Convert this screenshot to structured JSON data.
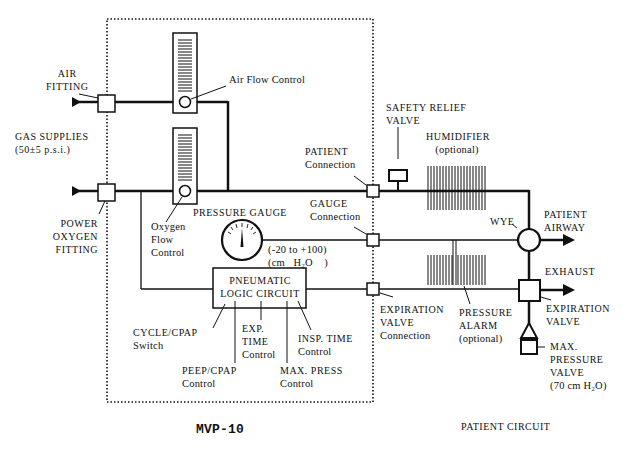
{
  "diagram": {
    "title": "MVP-10",
    "patient_circuit_title": "PATIENT CIRCUIT",
    "labels": {
      "air_fitting": [
        "AIR",
        "FITTING"
      ],
      "gas_supplies": [
        "GAS SUPPLIES",
        "(50±5 p.s.i.)"
      ],
      "power_oxygen_fitting": [
        "POWER",
        "OXYGEN",
        "FITTING"
      ],
      "air_flow_control": "Air Flow Control",
      "oxygen_flow_control": [
        "Oxygen",
        "Flow",
        "Control"
      ],
      "pressure_gauge": "PRESSURE GAUGE",
      "gauge_range": [
        "(-20 to +100)",
        "(cm   H₂O    )"
      ],
      "pneumatic_logic": [
        "PNEUMATIC",
        "LOGIC CIRCUIT"
      ],
      "cycle_cpap": [
        "CYCLE/CPAP",
        "Switch"
      ],
      "peep_cpap": [
        "PEEP/CPAP",
        "Control"
      ],
      "exp_time": [
        "EXP.",
        "TIME",
        "Control"
      ],
      "max_press": [
        "MAX. PRESS",
        "Control"
      ],
      "insp_time": [
        "INSP. TIME",
        "Control"
      ],
      "patient_connection": [
        "PATIENT",
        "Connection"
      ],
      "gauge_connection": [
        "GAUGE",
        "Connection"
      ],
      "expiration_valve_connection": [
        "EXPIRATION",
        "VALVE",
        "Connection"
      ],
      "safety_relief_valve": [
        "SAFETY RELIEF",
        "VALVE"
      ],
      "humidifier": [
        "HUMIDIFIER",
        "(optional)"
      ],
      "pressure_alarm": [
        "PRESSURE",
        "ALARM",
        "(optional)"
      ],
      "wye": "WYE",
      "patient_airway": [
        "PATIENT",
        "AIRWAY"
      ],
      "exhaust": "EXHAUST",
      "expiration_valve": [
        "EXPIRATION",
        "VALVE"
      ],
      "max_pressure_valve": [
        "MAX.",
        "PRESSURE",
        "VALVE",
        "(70 cm H₂O)"
      ]
    }
  }
}
